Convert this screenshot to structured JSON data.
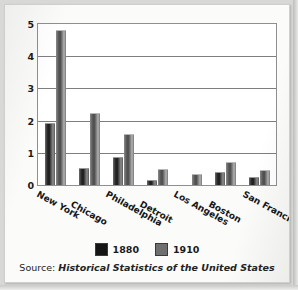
{
  "chart_data": {
    "type": "bar",
    "title": "",
    "xlabel": "",
    "ylabel": "People in millions",
    "ylim": [
      0,
      5
    ],
    "yticks": [
      "0",
      "1",
      "2",
      "3",
      "4",
      "5"
    ],
    "grid": true,
    "legend_position": "bottom",
    "categories": [
      "New York",
      "Chicago",
      "Philadelphia",
      "Detroit",
      "Los Angeles",
      "Boston",
      "San Francisco"
    ],
    "series": [
      {
        "name": "1880",
        "color": "#151515",
        "values": [
          1.9,
          0.5,
          0.85,
          0.12,
          0.0,
          0.36,
          0.23
        ]
      },
      {
        "name": "1910",
        "color": "#6f6f6f",
        "values": [
          4.77,
          2.2,
          1.55,
          0.46,
          0.32,
          0.67,
          0.42
        ]
      }
    ],
    "source_prefix": "Source:",
    "source_title": "Historical Statistics of the United States"
  }
}
